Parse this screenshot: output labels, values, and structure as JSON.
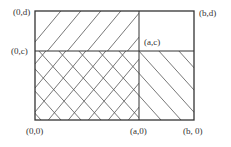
{
  "diagram": {
    "labels": {
      "top_left": "(0,d)",
      "mid_left": "(0,c)",
      "bottom_left": "(0,0)",
      "bottom_mid": "(a,0)",
      "bottom_right": "(b, 0)",
      "top_right": "(b,d)",
      "center": "(a,c)"
    },
    "colors": {
      "line": "#333333",
      "hatch": "#555555",
      "background": "#ffffff"
    },
    "regions": [
      {
        "name": "upper-left-band",
        "hatch": "forward-diagonal"
      },
      {
        "name": "lower-left-cross",
        "hatch": "cross-diagonal"
      },
      {
        "name": "lower-right",
        "hatch": "back-diagonal"
      },
      {
        "name": "upper-right",
        "hatch": "none"
      }
    ]
  }
}
